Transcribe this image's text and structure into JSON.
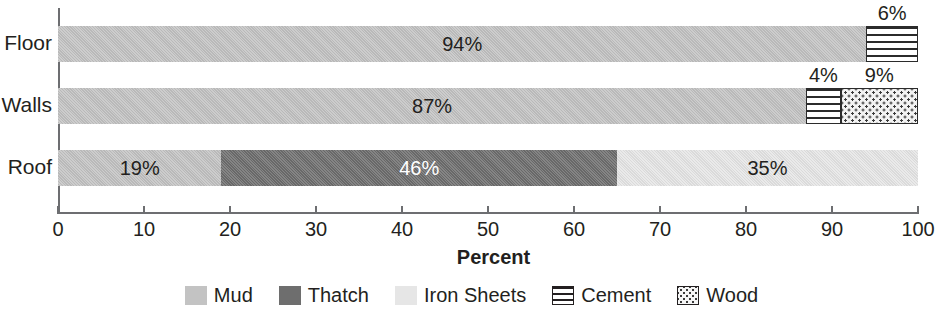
{
  "chart_data": {
    "type": "bar",
    "orientation": "horizontal",
    "stacked": true,
    "title": "",
    "xlabel": "Percent",
    "ylabel": "",
    "xlim": [
      0,
      100
    ],
    "xticks": [
      0,
      10,
      20,
      30,
      40,
      50,
      60,
      70,
      80,
      90,
      100
    ],
    "xtick_labels": [
      "0",
      "10",
      "20",
      "30",
      "40",
      "50",
      "60",
      "70",
      "80",
      "90",
      "100"
    ],
    "grid": false,
    "legend_position": "bottom",
    "categories": [
      "Floor",
      "Walls",
      "Roof"
    ],
    "series": [
      {
        "name": "Mud",
        "color": "#c3c3c3",
        "pattern": "solid",
        "values": [
          94,
          87,
          19
        ]
      },
      {
        "name": "Thatch",
        "color": "#6e6e6e",
        "pattern": "solid",
        "values": [
          0,
          0,
          46
        ]
      },
      {
        "name": "Iron Sheets",
        "color": "#e6e6e6",
        "pattern": "solid",
        "values": [
          0,
          0,
          35
        ]
      },
      {
        "name": "Cement",
        "color": "#ffffff",
        "pattern": "horizontal-stripes",
        "values": [
          6,
          4,
          0
        ]
      },
      {
        "name": "Wood",
        "color": "#f2f2f2",
        "pattern": "dots",
        "values": [
          0,
          9,
          0
        ]
      }
    ],
    "bars": [
      {
        "category": "Floor",
        "segments": [
          {
            "series": "Mud",
            "value": 94,
            "label": "94%",
            "start": 0,
            "label_position": "inside",
            "label_color": "dark"
          },
          {
            "series": "Cement",
            "value": 6,
            "label": "6%",
            "start": 94,
            "label_position": "above",
            "label_color": "dark"
          }
        ]
      },
      {
        "category": "Walls",
        "segments": [
          {
            "series": "Mud",
            "value": 87,
            "label": "87%",
            "start": 0,
            "label_position": "inside",
            "label_color": "dark"
          },
          {
            "series": "Cement",
            "value": 4,
            "label": "4%",
            "start": 87,
            "label_position": "above",
            "label_color": "dark"
          },
          {
            "series": "Wood",
            "value": 9,
            "label": "9%",
            "start": 91,
            "label_position": "above",
            "label_color": "dark"
          }
        ]
      },
      {
        "category": "Roof",
        "segments": [
          {
            "series": "Mud",
            "value": 19,
            "label": "19%",
            "start": 0,
            "label_position": "inside",
            "label_color": "dark"
          },
          {
            "series": "Thatch",
            "value": 46,
            "label": "46%",
            "start": 19,
            "label_position": "inside",
            "label_color": "light"
          },
          {
            "series": "Iron Sheets",
            "value": 35,
            "label": "35%",
            "start": 65,
            "label_position": "inside",
            "label_color": "dark"
          }
        ]
      }
    ]
  },
  "axis": {
    "x_title": "Percent",
    "tick_labels": [
      "0",
      "10",
      "20",
      "30",
      "40",
      "50",
      "60",
      "70",
      "80",
      "90",
      "100"
    ]
  },
  "category_labels": [
    "Floor",
    "Walls",
    "Roof"
  ],
  "legend": {
    "items": [
      {
        "label": "Mud",
        "swatch": "mud-swatch"
      },
      {
        "label": "Thatch",
        "swatch": "thatch-swatch"
      },
      {
        "label": "Iron Sheets",
        "swatch": "iron-sheets-swatch"
      },
      {
        "label": "Cement",
        "swatch": "cement-swatch"
      },
      {
        "label": "Wood",
        "swatch": "wood-swatch"
      }
    ]
  }
}
